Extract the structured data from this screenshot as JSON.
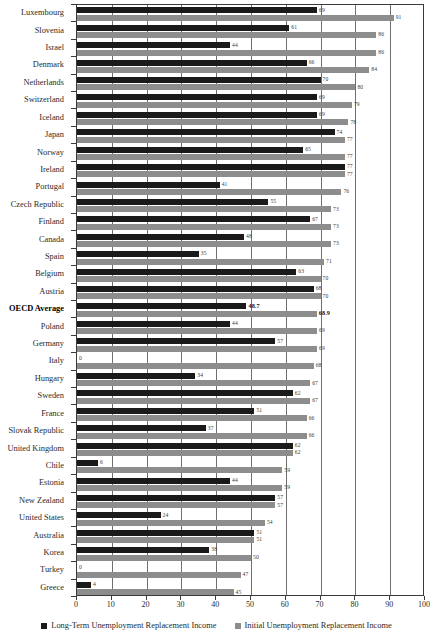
{
  "chart_data": {
    "type": "bar",
    "orientation": "horizontal",
    "title": "",
    "subtitle": "",
    "xlabel": "",
    "ylabel": "",
    "xlim": [
      0,
      100
    ],
    "xticks": [
      0,
      10,
      20,
      30,
      40,
      50,
      60,
      70,
      80,
      90,
      100
    ],
    "grid": true,
    "grid_axis": "x",
    "legend_position": "bottom",
    "categories": [
      "Luxembourg",
      "Slovenia",
      "Israel",
      "Denmark",
      "Netherlands",
      "Switzerland",
      "Iceland",
      "Japan",
      "Norway",
      "Ireland",
      "Portugal",
      "Czech Republic",
      "Finland",
      "Canada",
      "Spain",
      "Belgium",
      "Austria",
      "OECD Average",
      "Poland",
      "Germany",
      "Italy",
      "Hungary",
      "Sweden",
      "France",
      "Slovak Republic",
      "United Kingdom",
      "Chile",
      "Estonia",
      "New Zealand",
      "United States",
      "Australia",
      "Korea",
      "Turkey",
      "Greece"
    ],
    "highlight_category": "OECD Average",
    "series": [
      {
        "name": "Long-Term Unemployment Replacement Income",
        "color": "#1a1a1a",
        "values": [
          69,
          61,
          44,
          66,
          70,
          69,
          69,
          74,
          65,
          77,
          41,
          55,
          67,
          48,
          35,
          63,
          68,
          48.7,
          44,
          57,
          0,
          34,
          62,
          51,
          37,
          62,
          6,
          44,
          57,
          24,
          51,
          38,
          0,
          4
        ],
        "labels": [
          "69",
          "61",
          "44",
          "66",
          "70",
          "69",
          "69",
          "74",
          "65",
          "77",
          "41",
          "55",
          "67",
          "48",
          "35",
          "63",
          "68",
          "48.7",
          "44",
          "57",
          "0",
          "34",
          "62",
          "51",
          "37",
          "62",
          "6",
          "44",
          "57",
          "24",
          "51",
          "38",
          "0",
          "4"
        ]
      },
      {
        "name": "Initial Unemployment Replacement Income",
        "color": "#8d8d8d",
        "values": [
          91,
          86,
          86,
          84,
          80,
          79,
          78,
          77,
          77,
          77,
          76,
          73,
          73,
          73,
          71,
          70,
          70,
          68.9,
          69,
          69,
          68,
          67,
          67,
          66,
          66,
          62,
          59,
          59,
          57,
          54,
          51,
          50,
          47,
          45
        ],
        "labels": [
          "91",
          "86",
          "86",
          "84",
          "80",
          "79",
          "78",
          "77",
          "77",
          "77",
          "76",
          "73",
          "73",
          "73",
          "71",
          "70",
          "70",
          "68.9",
          "69",
          "69",
          "68",
          "67",
          "67",
          "66",
          "66",
          "62",
          "59",
          "59",
          "57",
          "54",
          "51",
          "50",
          "47",
          "45"
        ]
      }
    ]
  },
  "legend": {
    "items": [
      {
        "label": "Long-Term Unemployment Replacement Income",
        "swatch": "sw-long"
      },
      {
        "label": "Initial Unemployment Replacement Income",
        "swatch": "sw-init"
      }
    ]
  }
}
